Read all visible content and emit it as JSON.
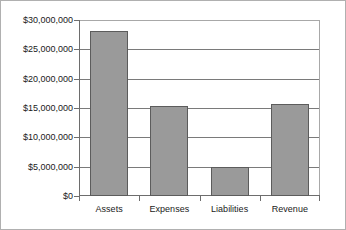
{
  "chart_data": {
    "type": "bar",
    "title": "",
    "subtitle": "",
    "xlabel": "",
    "ylabel": "",
    "categories": [
      "Assets",
      "Expenses",
      "Liabilities",
      "Revenue"
    ],
    "values": [
      28100000,
      15300000,
      5000000,
      15600000
    ],
    "series": [
      {
        "name": "",
        "values": [
          28100000,
          15300000,
          5000000,
          15600000
        ]
      }
    ],
    "ylim": [
      0,
      30000000
    ],
    "ytick_values": [
      0,
      5000000,
      10000000,
      15000000,
      20000000,
      25000000,
      30000000
    ],
    "ytick_labels": [
      "$0",
      "$5,000,000",
      "$10,000,000",
      "$15,000,000",
      "$20,000,000",
      "$25,000,000",
      "$30,000,000"
    ],
    "grid": true,
    "grid_axis": "y",
    "legend": false,
    "legend_position": "none",
    "bar_color": "#9a9a9a",
    "bar_border_color": "#5c5c5c",
    "axis_color": "#6d6d6d",
    "gridline_color": "#7a7a7a",
    "plot_background": "#ffffff",
    "frame_color": "#b0b0b0",
    "annotations": []
  }
}
